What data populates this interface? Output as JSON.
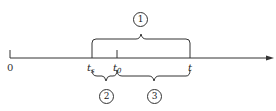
{
  "diagram": {
    "type": "timeline",
    "axis": {
      "origin_label": "0",
      "direction": "right-arrow"
    },
    "ticks": [
      {
        "label": "t",
        "sub": "s",
        "x": 92
      },
      {
        "label": "t",
        "sub": "0",
        "x": 117
      },
      {
        "label": "t",
        "sub": "",
        "x": 190
      }
    ],
    "braces": [
      {
        "id": "1",
        "label": "1",
        "from": "t_s",
        "to": "t",
        "position": "above"
      },
      {
        "id": "2",
        "label": "2",
        "from": "t_s",
        "to": "t_0",
        "position": "below"
      },
      {
        "id": "3",
        "label": "3",
        "from": "t_0",
        "to": "t",
        "position": "below"
      }
    ],
    "colors": {
      "line": "#333333",
      "background": "#ffffff"
    }
  }
}
